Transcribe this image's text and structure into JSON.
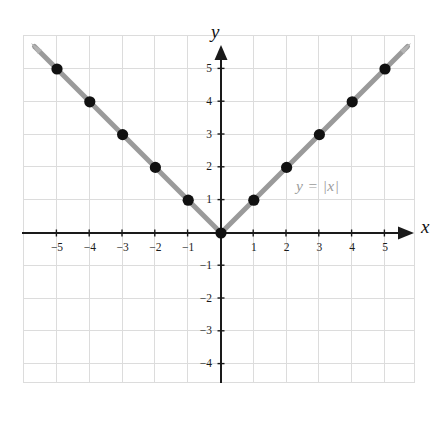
{
  "figure": {
    "kind": "coordinate-plane-graph",
    "background_color": "#ffffff",
    "grid_color": "#dcdcdc",
    "axis_color": "#1a1a1a",
    "curve_color": "#9a9a9a",
    "point_color": "#111111",
    "equation_label_color": "#9b9b9b"
  },
  "labels": {
    "y_axis_name": "y",
    "x_axis_name": "x",
    "equation": "y = |x|"
  },
  "chart_data": {
    "type": "line",
    "title": "",
    "subtitle": "",
    "xlabel": "x",
    "ylabel": "y",
    "equation": "y = |x|",
    "xlim": [
      -6,
      5.9
    ],
    "ylim": [
      -5.1,
      5.95
    ],
    "xticks": [
      -5,
      -4,
      -3,
      -2,
      -1,
      1,
      2,
      3,
      4,
      5
    ],
    "yticks": [
      5,
      4,
      3,
      2,
      1,
      -1,
      -2,
      -3,
      -4
    ],
    "xtick_labels": [
      "-5",
      "-4",
      "-3",
      "-2",
      "-1",
      "1",
      "2",
      "3",
      "4",
      "5"
    ],
    "ytick_labels": [
      "5",
      "4",
      "3",
      "2",
      "1",
      "-1",
      "-2",
      "-3",
      "-4"
    ],
    "grid": true,
    "grid_spacing": 1,
    "legend": null,
    "series": [
      {
        "name": "y = |x|",
        "style": "line-with-markers",
        "color": "#9a9a9a",
        "marker_color": "#111111",
        "x": [
          -5,
          -4,
          -3,
          -2,
          -1,
          0,
          1,
          2,
          3,
          4,
          5
        ],
        "values": [
          5,
          4,
          3,
          2,
          1,
          0,
          1,
          2,
          3,
          4,
          5
        ]
      }
    ],
    "annotations": [
      {
        "text": "y = |x|",
        "x": 2.3,
        "y": 1.55,
        "color": "#9b9b9b"
      }
    ]
  }
}
